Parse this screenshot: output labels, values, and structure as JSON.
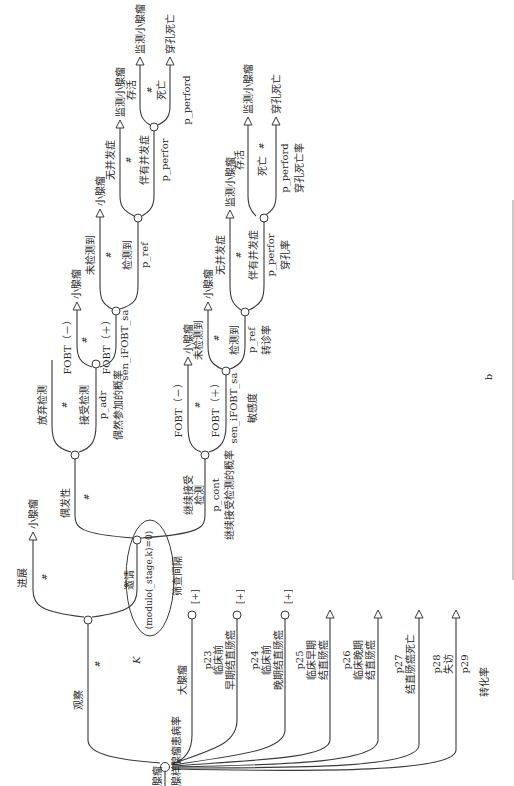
{
  "figure_label": "b",
  "root": {
    "name": "腺瘤",
    "subtitle": "腺样腺瘤患病率"
  },
  "observe": {
    "label": "观察",
    "hash": "#",
    "k_label": "K"
  },
  "progress": {
    "label": "进展",
    "hash": "#",
    "terminal": "小腺瘤"
  },
  "invite": {
    "label": "邀请",
    "condition": "(modulo(_stage,k)=0)",
    "interval": "筛查间隔"
  },
  "incidence": {
    "label": "偶发性",
    "hash": "#"
  },
  "adhoc": {
    "abandon": "放弃检测",
    "hash": "#",
    "accept": "接受检测",
    "prob": "p_adr",
    "prob_desc": "偶然参加的概率",
    "fobt_neg": "FOBT（－）",
    "fobt_neg_terminal": "小腺瘤",
    "fobt_pos": "FOBT（＋）",
    "fobt_hash": "#",
    "fobt_prob": "sen_iFOBT_sa",
    "undetected": "未检测到",
    "undetected_terminal": "小腺瘤",
    "detected": "检测到",
    "det_hash": "#",
    "det_prob": "p_ref",
    "no_comp": "无并发症",
    "no_comp_terminal": "监测小腺瘤",
    "with_comp": "伴有并发症",
    "comp_hash": "#",
    "comp_prob": "p_perfor",
    "survive": "存活",
    "survive_terminal": "监测小腺瘤",
    "death": "死亡",
    "death_hash": "#",
    "death_terminal": "穿孔死亡",
    "death_prob": "p_perford"
  },
  "continue": {
    "label": "继续接受检测",
    "prob": "p_cont",
    "prob_desc": "继续接受检测的概率",
    "fobt_neg": "FOBT（－）",
    "fobt_neg_terminal": "小腺瘤",
    "fobt_pos": "FOBT（＋）",
    "fobt_hash": "#",
    "fobt_prob": "sen_iFOBT_sa",
    "fobt_desc": "敏感度",
    "undetected": "未检测到",
    "undetected_terminal": "小腺瘤",
    "detected": "检测到",
    "det_hash": "#",
    "det_prob": "p_ref",
    "det_desc": "转诊率",
    "no_comp": "无并发症",
    "no_comp_terminal": "监测小腺瘤",
    "with_comp": "伴有并发症",
    "comp_hash": "#",
    "comp_prob": "p_perfor",
    "comp_desc": "穿孔率",
    "survive": "存活",
    "survive_terminal": "监测小腺瘤",
    "death": "死亡",
    "death_hash": "#",
    "death_terminal": "穿孔死亡",
    "death_prob": "p_perford",
    "death_desc": "穿孔死亡率"
  },
  "transitions": {
    "large": {
      "label": "大腺瘤",
      "mark": "[+]"
    },
    "p23": {
      "prob": "p23",
      "line1": "临床前",
      "line2": "早期结直肠癌",
      "mark": "[+]"
    },
    "p24": {
      "prob": "p24",
      "line1": "临床前",
      "line2": "晚期结直肠癌",
      "mark": "[+]"
    },
    "p25": {
      "prob": "p25",
      "line1": "临床早期",
      "line2": "结直肠癌"
    },
    "p26": {
      "prob": "p26",
      "line1": "临床晚期",
      "line2": "结直肠癌"
    },
    "p27": {
      "prob": "p27",
      "line1": "结直肠癌死亡"
    },
    "p28": {
      "prob": "p28",
      "line1": "失访"
    },
    "p29": {
      "prob": "p29"
    },
    "rate_label": "转化率"
  }
}
